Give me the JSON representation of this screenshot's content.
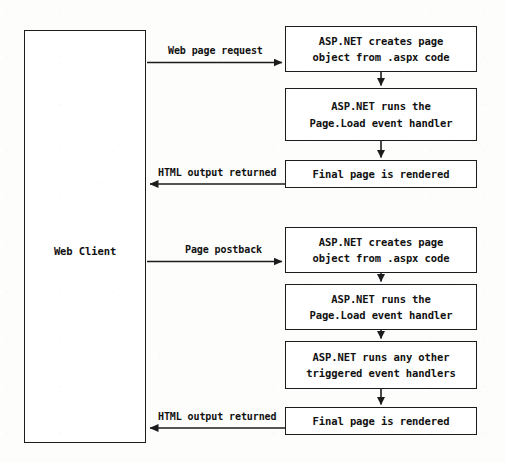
{
  "diagram": {
    "type": "flowchart",
    "background_color": "#fdfdfc",
    "stroke_color": "#1c1c1c",
    "text_color": "#111111"
  },
  "client": {
    "label": "Web Client"
  },
  "request_flow": {
    "label": "Web page request",
    "return_label": "HTML output returned",
    "steps": [
      {
        "line1": "ASP.NET creates page",
        "line2": "object from .aspx code"
      },
      {
        "line1": "ASP.NET runs the",
        "line2": "Page.Load event handler"
      },
      {
        "line1": "Final page is rendered",
        "line2": ""
      }
    ]
  },
  "postback_flow": {
    "label": "Page postback",
    "return_label": "HTML output returned",
    "steps": [
      {
        "line1": "ASP.NET creates page",
        "line2": "object from .aspx code"
      },
      {
        "line1": "ASP.NET runs the",
        "line2": "Page.Load event handler"
      },
      {
        "line1": "ASP.NET runs any other",
        "line2": "triggered event handlers"
      },
      {
        "line1": "Final page is rendered",
        "line2": ""
      }
    ]
  }
}
